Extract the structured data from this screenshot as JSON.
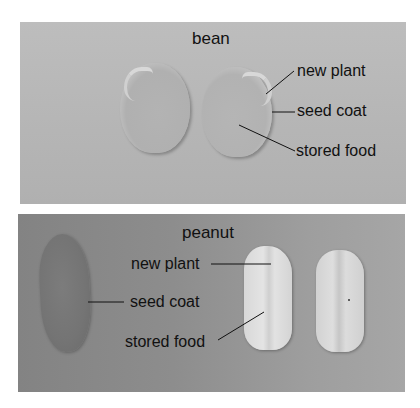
{
  "bean_panel": {
    "title": "bean",
    "labels": {
      "new_plant": "new plant",
      "seed_coat": "seed coat",
      "stored_food": "stored food"
    },
    "background": "#b8b8b8"
  },
  "peanut_panel": {
    "title": "peanut",
    "labels": {
      "new_plant": "new plant",
      "seed_coat": "seed coat",
      "stored_food": "stored food"
    },
    "background": "#8e8e8e"
  }
}
